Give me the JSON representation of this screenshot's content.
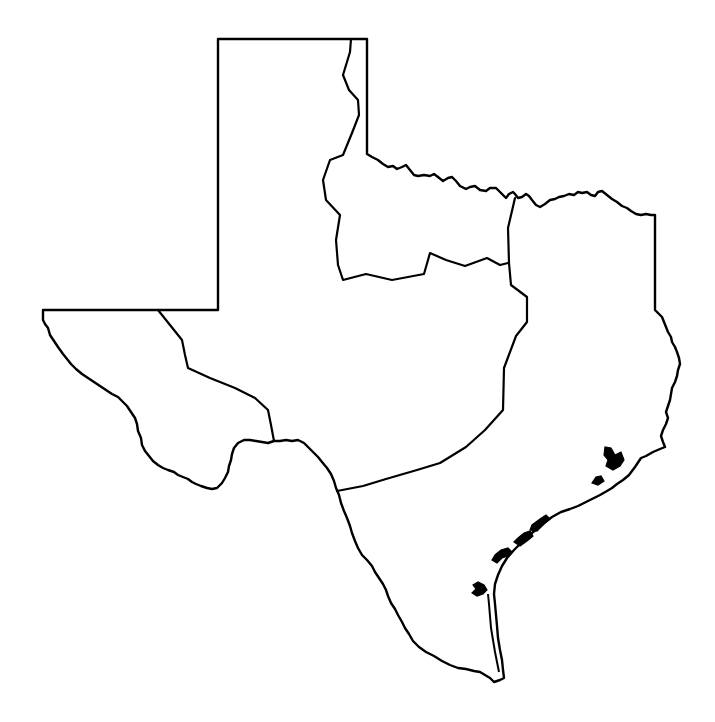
{
  "map": {
    "subject": "Texas",
    "style": "blank outline map with region boundaries",
    "regions_count": 5,
    "regions": [
      {
        "id": "trans-pecos",
        "label": ""
      },
      {
        "id": "high-plains-panhandle",
        "label": ""
      },
      {
        "id": "north-central-plains",
        "label": ""
      },
      {
        "id": "edwards-plateau-central",
        "label": ""
      },
      {
        "id": "gulf-coastal-plains",
        "label": ""
      }
    ],
    "colors": {
      "background": "#ffffff",
      "stroke": "#000000",
      "fill": "#ffffff"
    }
  }
}
